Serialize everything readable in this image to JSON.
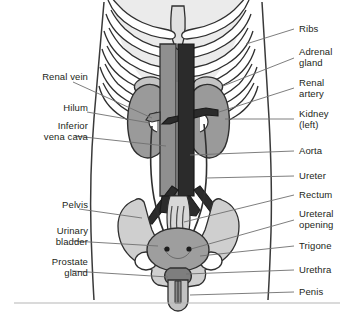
{
  "figure": {
    "colors": {
      "ink": "#231f20",
      "leader": "#6f6f6f",
      "body_fill": "#ffffff",
      "skeleton_fill": "#e4e4e4",
      "bone_fill": "#d6d6d6",
      "kidney_fill": "#9a9a9a",
      "vein_fill": "#8f8f8f",
      "aorta_fill": "#2b2b2b",
      "bladder_fill": "#9e9e9e",
      "adrenal_fill": "#c0c0c0",
      "rule": "#b5b5b5"
    }
  },
  "labels_left": [
    {
      "id": "renal-vein",
      "text": "Renal vein",
      "x": 16,
      "y": 77,
      "lines": 1
    },
    {
      "id": "hilum",
      "text": "Hilum",
      "x": 59,
      "y": 108,
      "lines": 1
    },
    {
      "id": "inferior-vena-cava",
      "text": "Inferior\nvena cava",
      "x": 27,
      "y": 126,
      "lines": 2
    },
    {
      "id": "pelvis",
      "text": "Pelvis",
      "x": 41,
      "y": 205,
      "lines": 1
    },
    {
      "id": "urinary-bladder",
      "text": "Urinary\nbladder",
      "x": 33,
      "y": 231,
      "lines": 2
    },
    {
      "id": "prostate-gland",
      "text": "Prostate\ngland",
      "x": 27,
      "y": 262,
      "lines": 2
    }
  ],
  "labels_right": [
    {
      "id": "ribs",
      "text": "Ribs",
      "x": 299,
      "y": 25,
      "lines": 1
    },
    {
      "id": "adrenal-gland",
      "text": "Adrenal\ngland",
      "x": 299,
      "y": 48,
      "lines": 2
    },
    {
      "id": "renal-artery",
      "text": "Renal\nartery",
      "x": 299,
      "y": 79,
      "lines": 2
    },
    {
      "id": "kidney-left",
      "text": "Kidney\n(left)",
      "x": 299,
      "y": 110,
      "lines": 2
    },
    {
      "id": "aorta",
      "text": "Aorta",
      "x": 299,
      "y": 147,
      "lines": 1
    },
    {
      "id": "ureter",
      "text": "Ureter",
      "x": 299,
      "y": 172,
      "lines": 1
    },
    {
      "id": "rectum",
      "text": "Rectum",
      "x": 299,
      "y": 191,
      "lines": 1
    },
    {
      "id": "ureteral-opening",
      "text": "Ureteral\nopening",
      "x": 299,
      "y": 210,
      "lines": 2
    },
    {
      "id": "trigone",
      "text": "Trigone",
      "x": 299,
      "y": 242,
      "lines": 1
    },
    {
      "id": "urethra",
      "text": "Urethra",
      "x": 299,
      "y": 266,
      "lines": 1
    },
    {
      "id": "penis",
      "text": "Penis",
      "x": 299,
      "y": 288,
      "lines": 1
    }
  ]
}
